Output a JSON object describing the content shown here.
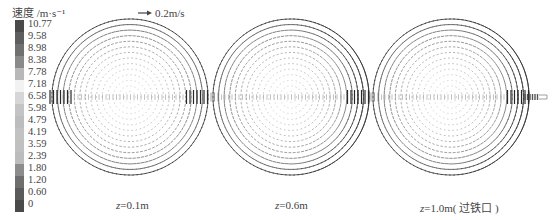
{
  "chart_data": {
    "type": "vector_field",
    "title": "",
    "legend": {
      "title": "速度 /m·s⁻¹",
      "position": "left",
      "levels": [
        "10.77",
        "9.58",
        "8.98",
        "8.38",
        "7.78",
        "7.18",
        "6.58",
        "5.98",
        "4.79",
        "4.19",
        "3.59",
        "2.39",
        "1.80",
        "1.20",
        "0.60",
        "0"
      ],
      "colors": [
        "#4a4a4a",
        "#5e5e5e",
        "#707070",
        "#8a8a8a",
        "#b8b8b8",
        "#f2f2f2",
        "#d6d6d6",
        "#c4c4c4",
        "#bdbdbd",
        "#c2c2c2",
        "#c0c0c0",
        "#bcbcbc",
        "#8c8c8c",
        "#6e6e6e",
        "#5a5a5a",
        "#4a4a4a"
      ]
    },
    "reference_vector": {
      "label": "0.2m/s",
      "value": 0.2,
      "unit": "m/s"
    },
    "panels": [
      {
        "caption_var": "z",
        "caption_rest": "=0.1m",
        "z": 0.1,
        "cx": 130,
        "cy": 97,
        "r": 78,
        "tap_hole": false,
        "jets": "both"
      },
      {
        "caption_var": "z",
        "caption_rest": "=0.6m",
        "z": 0.6,
        "cx": 291,
        "cy": 97,
        "r": 78,
        "tap_hole": false,
        "jets": "right"
      },
      {
        "caption_var": "z",
        "caption_rest": "=1.0m( 过铁口 )",
        "z": 1.0,
        "cx": 451,
        "cy": 97,
        "r": 78,
        "tap_hole": true,
        "jets": "right"
      }
    ],
    "grid": false,
    "xlabel": "",
    "ylabel": ""
  },
  "legend_title": "速度 /m·s⁻¹",
  "reference_label": "0.2m/s",
  "captions": [
    {
      "var": "z",
      "rest": "=0.1m"
    },
    {
      "var": "z",
      "rest": "=0.6m"
    },
    {
      "var": "z",
      "rest": "=1.0m( 过铁口 )"
    }
  ]
}
